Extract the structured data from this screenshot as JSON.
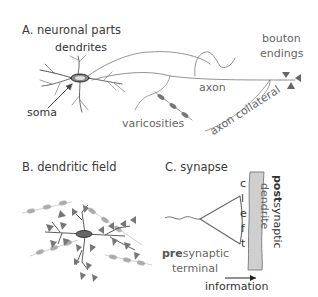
{
  "panels": {
    "a": {
      "title": "A. neuronal parts",
      "labels": {
        "dendrites": "dendrites",
        "soma": "soma",
        "axon": "axon",
        "varicosities": "varicosities",
        "axon_collateral": "axon collateral",
        "bouton_line1": "bouton",
        "bouton_line2": "endings"
      }
    },
    "b": {
      "title": "B. dendritic field"
    },
    "c": {
      "title": "C. synapse",
      "cleft_letters": [
        "c",
        "l",
        "e",
        "f",
        "t"
      ],
      "postsynaptic_bold": "post",
      "postsynaptic_rest": "synaptic",
      "dendrite": "dendrite",
      "presynaptic_bold": "pre",
      "presynaptic_rest": "synaptic",
      "terminal": "terminal",
      "information": "information"
    }
  },
  "colors": {
    "line": "#444444",
    "light_line": "#999999",
    "bouton": "#666666",
    "varicosity": "#888888",
    "light_varicosity": "#aaaaaa",
    "dendrite_fill": "#cccccc"
  }
}
